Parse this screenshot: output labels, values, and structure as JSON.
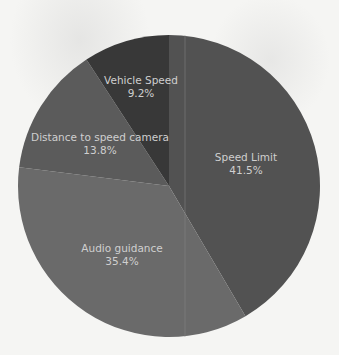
{
  "chart_data": {
    "type": "pie",
    "title": "",
    "start_angle_deg": 0,
    "direction": "clockwise",
    "center": [
      169,
      186
    ],
    "radius": 151,
    "categories": [
      "Speed Limit",
      "Audio guidance",
      "Distance to speed camera",
      "Vehicle Speed"
    ],
    "values": [
      41.5,
      35.4,
      13.8,
      9.2
    ],
    "value_labels": [
      "41.5%",
      "35.4%",
      "13.8%",
      "9.2%"
    ],
    "colors": [
      "#525252",
      "#6a6a6a",
      "#5b5b5b",
      "#383838"
    ],
    "label_color": "#cfcfcf",
    "legend": "none",
    "data_labels": "inside"
  },
  "slices": [
    {
      "name": "Speed Limit",
      "pct": "41.5%",
      "label_x": 246,
      "label_y": 161
    },
    {
      "name": "Audio guidance",
      "pct": "35.4%",
      "label_x": 122,
      "label_y": 252
    },
    {
      "name": "Distance to speed camera",
      "pct": "13.8%",
      "label_x": 100,
      "label_y": 141
    },
    {
      "name": "Vehicle Speed",
      "pct": "9.2%",
      "label_x": 141,
      "label_y": 84
    }
  ]
}
